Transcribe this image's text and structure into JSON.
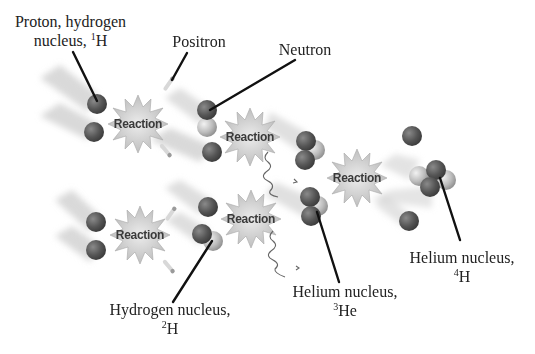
{
  "diagram": {
    "labels": {
      "proton": {
        "line1": "Proton, hydrogen",
        "line2_text": "nucleus, ",
        "line2_sup": "1",
        "line2_sym": "H"
      },
      "positron": {
        "text": "Positron"
      },
      "neutron": {
        "text": "Neutron"
      },
      "deuterium": {
        "line1": "Hydrogen nucleus,",
        "sup": "2",
        "sym": "H"
      },
      "helium3": {
        "line1": "Helium nucleus,",
        "sup": "3",
        "sym": "He"
      },
      "helium4": {
        "line1": "Helium nucleus,",
        "sup": "4",
        "sym": "H"
      }
    },
    "reactions": [
      {
        "id": "r1",
        "label": "Reaction"
      },
      {
        "id": "r2",
        "label": "Reaction"
      },
      {
        "id": "r3",
        "label": "Reaction"
      },
      {
        "id": "r4",
        "label": "Reaction"
      },
      {
        "id": "r5",
        "label": "Reaction"
      }
    ],
    "colors": {
      "proton": "#5a5a5a",
      "neutron": "#b8b8b8",
      "starburst": "#c9c9c9",
      "leader_line": "#111111"
    }
  }
}
